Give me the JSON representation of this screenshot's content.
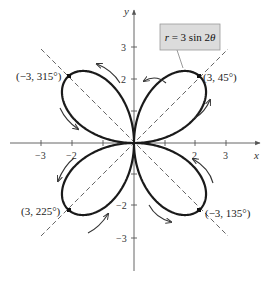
{
  "chart_data": {
    "type": "line",
    "subtype": "polar",
    "title": "",
    "equation_label": "r = 3 sin 2θ",
    "equation": "r = 3*sin(2*theta)",
    "xlabel": "x",
    "ylabel": "y",
    "xlim": [
      -3.5,
      3.5
    ],
    "ylim": [
      -3.5,
      3.5
    ],
    "x_ticks": [
      -3,
      -2,
      -1,
      1,
      2,
      3
    ],
    "x_tick_labels": [
      "−3",
      "−2",
      "",
      "",
      "2",
      "3"
    ],
    "y_ticks": [
      3,
      2,
      1,
      -1,
      -2,
      -3
    ],
    "y_tick_labels": [
      "3",
      "2",
      "",
      "",
      "−2",
      "−3"
    ],
    "grid": false,
    "series": [
      {
        "name": "r = 3 sin 2θ",
        "description": "four-petal rose curve",
        "theta_range_deg": [
          0,
          360
        ]
      }
    ],
    "reference_lines": [
      {
        "type": "dashed",
        "angle_deg": 45
      },
      {
        "type": "dashed",
        "angle_deg": 135
      }
    ],
    "annotations": [
      {
        "text": "(3, 45°)",
        "point_xy": [
          2.12,
          2.12
        ],
        "marked": true
      },
      {
        "text": "(−3, 315°)",
        "point_xy": [
          -2.12,
          2.12
        ],
        "marked": true
      },
      {
        "text": "(3, 225°)",
        "point_xy": [
          -2.12,
          -2.12
        ],
        "marked": true
      },
      {
        "text": "(−3, 135°)",
        "point_xy": [
          2.12,
          -2.12
        ],
        "marked": true
      }
    ],
    "direction_arrows": "counterclockwise-tracing arrows along each petal"
  },
  "labels": {
    "equation": "r = 3 sin 2θ",
    "x_axis": "x",
    "y_axis": "y",
    "pt_q1": "(3, 45°)",
    "pt_q2": "(−3, 315°)",
    "pt_q3": "(3, 225°)",
    "pt_q4": "(−3, 135°)",
    "xt_m3": "−3",
    "xt_m2": "−2",
    "xt_2": "2",
    "xt_3": "3",
    "yt_3": "3",
    "yt_2": "2",
    "yt_m2": "−2",
    "yt_m3": "−3"
  },
  "colors": {
    "curve": "#1a1a1a",
    "axis": "#555555",
    "dashed": "#555555",
    "label_box_fill": "#dcdcdc",
    "label_box_stroke": "#9a9a9a"
  }
}
